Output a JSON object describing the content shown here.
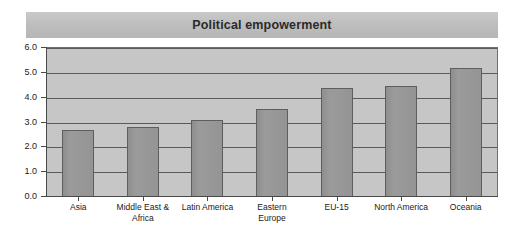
{
  "chart_data": {
    "type": "bar",
    "title": "Political empowerment",
    "xlabel": "",
    "ylabel": "",
    "ylim": [
      0.0,
      6.0
    ],
    "ytick_labels": [
      "0.0",
      "1.0",
      "2.0",
      "3.0",
      "4.0",
      "5.0",
      "6.0"
    ],
    "ytick_values": [
      0.0,
      1.0,
      2.0,
      3.0,
      4.0,
      5.0,
      6.0
    ],
    "grid": true,
    "legend": false,
    "legend_position": "none",
    "categories": [
      "Asia",
      "Middle East &\nAfrica",
      "Latin America",
      "Eastern\nEurope",
      "EU-15",
      "North America",
      "Oceania"
    ],
    "values": [
      2.7,
      2.8,
      3.1,
      3.55,
      4.4,
      4.45,
      5.2
    ],
    "colors": {
      "bar_fill": "#949494",
      "bar_border": "#5e5e5e",
      "plot_background": "#c6c6c6",
      "gridline": "#5a5a5a",
      "axis": "#4a4a4a",
      "title_band": "#bdbdbd",
      "title_text": "#2b2b2b",
      "page_background": "#ffffff"
    }
  }
}
